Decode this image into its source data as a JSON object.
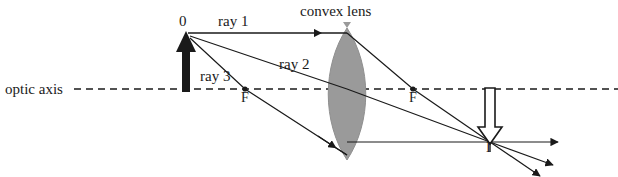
{
  "figure": {
    "labels": {
      "optic_axis": "optic axis",
      "object": "0",
      "ray1": "ray 1",
      "ray2": "ray 2",
      "ray3": "ray 3",
      "lens": "convex lens",
      "focal_left": "F",
      "focal_right": "F",
      "image": "I"
    },
    "colors": {
      "ink": "#1a1a1a",
      "lens_fill": "#9a9a9a",
      "lens_stroke": "#8a8a8a",
      "background": "#ffffff"
    },
    "geometry": {
      "axis_y": 89,
      "axis_x_start": 74,
      "axis_x_end": 618,
      "object_x": 186,
      "object_tip_y": 33,
      "object_base_y": 92,
      "lens_center_x": 347,
      "lens_top_y": 28,
      "lens_bottom_y": 160,
      "lens_half_width": 22,
      "focal_left_x": 245,
      "focal_right_x": 413,
      "image_x": 490,
      "image_tip_y": 142,
      "image_base_y": 88,
      "ray1_lens_y": 33,
      "ray3_lens_y": 155
    }
  }
}
